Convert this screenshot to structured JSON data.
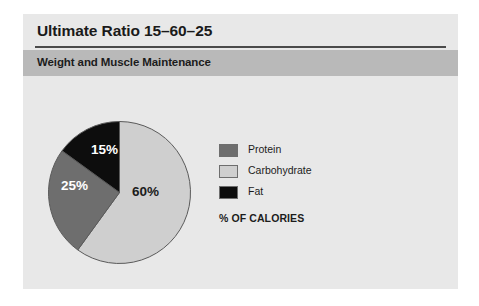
{
  "figure": {
    "title": "Ultimate Ratio 15–60–25",
    "subtitle": "Weight and Muscle Maintenance",
    "caption": "% OF CALORIES",
    "background": "#e8e8e8",
    "subtitle_band_color": "#b9b9b9",
    "rule_color": "#4a4a4a"
  },
  "chart_data": {
    "type": "pie",
    "title": "Ultimate Ratio 15–60–25",
    "subtitle": "Weight and Muscle Maintenance",
    "ylabel": "",
    "xlabel": "",
    "legend_position": "right",
    "grid": false,
    "start_angle_deg": 0,
    "direction": "clockwise",
    "categories": [
      "Protein",
      "Carbohydrate",
      "Fat"
    ],
    "values": [
      25,
      60,
      15
    ],
    "unit": "% of calories",
    "colors": [
      "#6e6e6e",
      "#cfcfcf",
      "#0d0d0d"
    ],
    "slices": [
      {
        "name": "Carbohydrate",
        "value": 60,
        "label": "60%",
        "color": "#cfcfcf",
        "label_color": "#1c1c1c",
        "order": 1
      },
      {
        "name": "Protein",
        "value": 25,
        "label": "25%",
        "color": "#6e6e6e",
        "label_color": "#ffffff",
        "order": 2
      },
      {
        "name": "Fat",
        "value": 15,
        "label": "15%",
        "color": "#0d0d0d",
        "label_color": "#ffffff",
        "order": 3
      }
    ],
    "legend": [
      {
        "label": "Protein",
        "color": "#6e6e6e"
      },
      {
        "label": "Carbohydrate",
        "color": "#cfcfcf"
      },
      {
        "label": "Fat",
        "color": "#0d0d0d"
      }
    ],
    "caption": "% OF CALORIES"
  }
}
